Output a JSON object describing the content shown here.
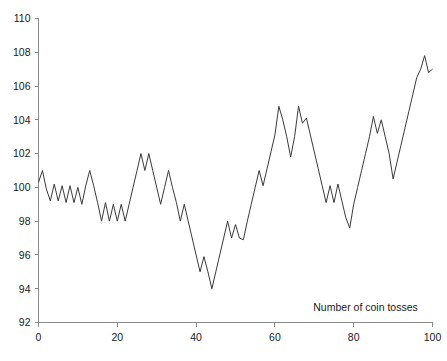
{
  "chart_data": {
    "type": "line",
    "title": "",
    "subtitle": "",
    "xlabel": "Number of coin tosses",
    "ylabel": "",
    "xlim": [
      0,
      100
    ],
    "ylim": [
      92,
      110
    ],
    "grid": false,
    "legend": false,
    "legend_position": "none",
    "annotations": [
      {
        "text": "Number of coin tosses",
        "x": 83,
        "y": 92.7,
        "role": "x-axis-caption"
      }
    ],
    "axes": {
      "x": {
        "label": "Number of coin tosses",
        "min": 0,
        "max": 100,
        "tick_interval": 20,
        "tick_labels": [
          "0",
          "20",
          "40",
          "60",
          "80",
          "100"
        ],
        "tick_values": [
          0,
          20,
          40,
          60,
          80,
          100
        ]
      },
      "y": {
        "label": "",
        "min": 92,
        "max": 110,
        "tick_interval": 2,
        "tick_labels": [
          "92",
          "94",
          "96",
          "98",
          "100",
          "102",
          "104",
          "106",
          "108",
          "110"
        ],
        "tick_values": [
          92,
          94,
          96,
          98,
          100,
          102,
          104,
          106,
          108,
          110
        ]
      }
    },
    "series": [
      {
        "name": "cumulative coin toss balance",
        "color": "#3a3a3a",
        "x": [
          0,
          1,
          2,
          3,
          4,
          5,
          6,
          7,
          8,
          9,
          10,
          11,
          12,
          13,
          14,
          15,
          16,
          17,
          18,
          19,
          20,
          21,
          22,
          23,
          24,
          25,
          26,
          27,
          28,
          29,
          30,
          31,
          32,
          33,
          34,
          35,
          36,
          37,
          38,
          39,
          40,
          41,
          42,
          43,
          44,
          45,
          46,
          47,
          48,
          49,
          50,
          51,
          52,
          53,
          54,
          55,
          56,
          57,
          58,
          59,
          60,
          61,
          62,
          63,
          64,
          65,
          66,
          67,
          68,
          69,
          70,
          71,
          72,
          73,
          74,
          75,
          76,
          77,
          78,
          79,
          80,
          81,
          82,
          83,
          84,
          85,
          86,
          87,
          88,
          89,
          90,
          91,
          92,
          93,
          94,
          95,
          96,
          97,
          98,
          99,
          100
        ],
        "values": [
          100.3,
          101.0,
          99.9,
          99.2,
          100.2,
          99.2,
          100.1,
          99.1,
          100.1,
          99.1,
          100.0,
          99.0,
          100.1,
          101.0,
          100.1,
          99.1,
          98.0,
          99.1,
          98.0,
          99.0,
          98.0,
          99.0,
          98.0,
          99.0,
          100.0,
          101.0,
          102.0,
          101.0,
          102.0,
          101.0,
          100.0,
          99.0,
          100.0,
          101.0,
          100.0,
          99.1,
          98.0,
          99.0,
          98.0,
          97.0,
          96.0,
          95.0,
          95.9,
          95.0,
          94.0,
          95.0,
          96.0,
          97.0,
          98.0,
          97.0,
          97.8,
          97.0,
          96.9,
          98.0,
          99.0,
          100.0,
          101.0,
          100.1,
          101.1,
          102.1,
          103.1,
          104.8,
          104.0,
          103.0,
          101.8,
          103.0,
          104.8,
          103.8,
          104.1,
          103.1,
          102.1,
          101.1,
          100.1,
          99.1,
          100.1,
          99.1,
          100.2,
          99.2,
          98.2,
          97.6,
          99.0,
          100.0,
          101.0,
          102.0,
          103.0,
          104.2,
          103.2,
          104.0,
          103.0,
          102.0,
          100.5,
          101.5,
          102.5,
          103.5,
          104.5,
          105.5,
          106.5,
          107.0,
          107.8,
          106.8,
          107.0
        ]
      }
    ]
  }
}
